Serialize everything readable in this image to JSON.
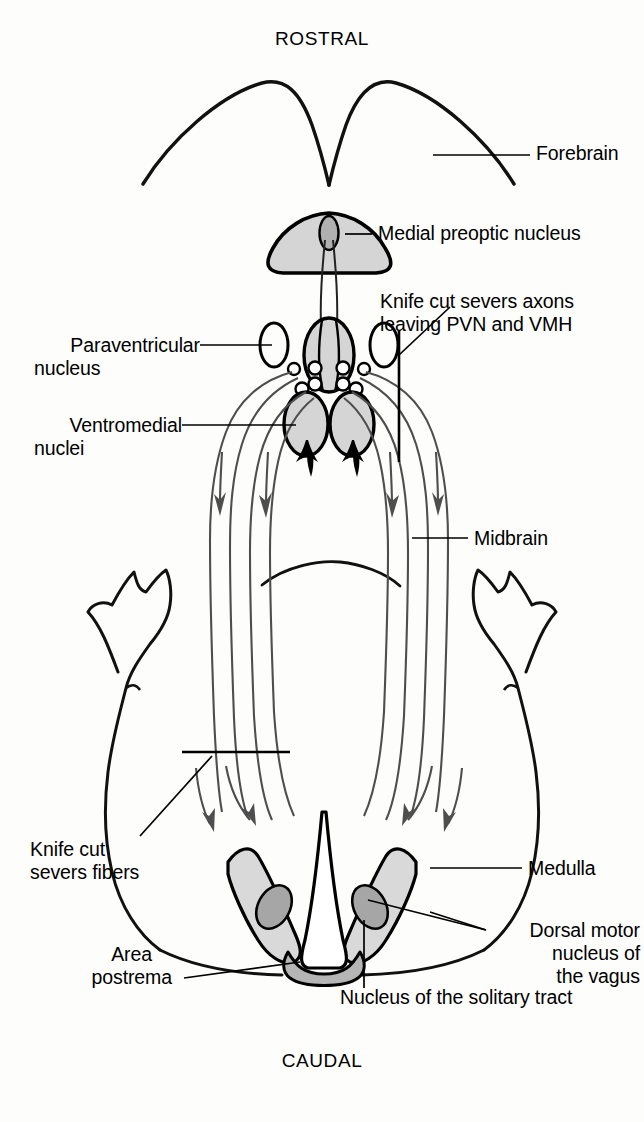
{
  "figure": {
    "type": "anatomical-diagram",
    "background_color": "#fdfdfc",
    "outline_color": "#000000",
    "fiber_color": "#4a4a4a"
  },
  "orientation": {
    "rostral": "ROSTRAL",
    "caudal": "CAUDAL"
  },
  "labels": {
    "forebrain": "Forebrain",
    "medial_preoptic_nucleus": "Medial preoptic nucleus",
    "knife_cut_axons_line1": "Knife cut severs axons",
    "knife_cut_axons_line2": "leaving PVN and VMH",
    "paraventricular_line1": "Paraventricular",
    "paraventricular_line2": "nucleus",
    "ventromedial_line1": "Ventromedial",
    "ventromedial_line2": "nuclei",
    "midbrain": "Midbrain",
    "knife_cut_fibers_line1": "Knife cut",
    "knife_cut_fibers_line2": "severs fibers",
    "medulla": "Medulla",
    "dorsal_motor_line1": "Dorsal motor",
    "dorsal_motor_line2": "nucleus of",
    "dorsal_motor_line3": "the vagus",
    "area_postrema_line1": "Area",
    "area_postrema_line2": "postrema",
    "nucleus_solitary_tract": "Nucleus of the solitary tract"
  },
  "colors": {
    "nucleus_light_fill": "#d5d5d5",
    "nucleus_mid_fill": "#c4c4c4",
    "nucleus_dark_fill": "#a6a6a6",
    "nts_fill": "#d9d9d9",
    "area_postrema_fill": "#b5b5b5",
    "stroke": "#000000",
    "fiber_stroke": "#4e4e4e"
  },
  "structures": {
    "forebrain": "two cerebral hemispheres forming a wide arc with a deep midline notch",
    "medial_preoptic_nucleus": "rounded triangular shaded body at midline with dark central ellipse",
    "paraventricular_nucleus": "paired open ellipses flanking midline oval",
    "ventromedial_nuclei": "paired shaded ovals with black ventral tails",
    "midbrain": "elongated brainstem with lateral constriction",
    "medulla": "flared caudal region with cerebellar lobes laterally",
    "nucleus_of_solitary_tract": "paired elongated light-gray wings",
    "dorsal_motor_nucleus_vagus": "paired small darker ovals inside NTS wings",
    "area_postrema": "shaded band at caudal midline"
  },
  "annotations": {
    "knife_cut_upper": "vertical line crossing descending axons lateral to PVN/VMH",
    "knife_cut_lower": "horizontal line crossing descending fibers above medulla",
    "descending_arrows_count": 8
  }
}
